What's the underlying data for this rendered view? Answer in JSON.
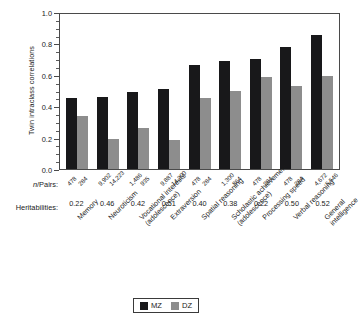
{
  "chart_data": {
    "type": "bar",
    "title": "",
    "xlabel": "",
    "ylabel": "Twin intraclass correlations",
    "ylim": [
      0.0,
      1.0
    ],
    "ytick_labels": [
      "0.0",
      "0.2",
      "0.4",
      "0.6",
      "0.8",
      "1.0"
    ],
    "ytick_values": [
      0.0,
      0.2,
      0.4,
      0.6,
      0.8,
      1.0
    ],
    "minor_tick_step": 0.05,
    "grid": false,
    "legend_position": "bottom-center",
    "categories": [
      "Memory",
      "Neuroticism",
      "Vocational interests (adolescence)",
      "Extraversion",
      "Spatial reasoning",
      "Scholastic achievement (adolescence)",
      "Processing speed",
      "Verbal reasoning",
      "General intelligence"
    ],
    "category_lines": [
      [
        "Memory",
        ""
      ],
      [
        "Neuroticism",
        ""
      ],
      [
        "Vocational interests",
        "(adolescence)"
      ],
      [
        "Extraversion",
        ""
      ],
      [
        "Spatial reasoning",
        ""
      ],
      [
        "Scholastic achievement",
        "(adolescence)"
      ],
      [
        "Processing speed",
        ""
      ],
      [
        "Verbal reasoning",
        ""
      ],
      [
        "General",
        "intelligence"
      ]
    ],
    "series": [
      {
        "name": "MZ",
        "color": "#18181a",
        "values": [
          0.45,
          0.46,
          0.49,
          0.51,
          0.66,
          0.685,
          0.7,
          0.775,
          0.855
        ]
      },
      {
        "name": "DZ",
        "color": "#8d8d8d",
        "values": [
          0.34,
          0.19,
          0.26,
          0.185,
          0.455,
          0.495,
          0.585,
          0.53,
          0.595
        ]
      }
    ],
    "annotation_rows": [
      {
        "label": "n/Pairs:",
        "label_italic_prefix": "n",
        "label_rest": "/Pairs:",
        "mz_values": [
          "478",
          "9,902",
          "1,486",
          "9,887",
          "478",
          "1,300",
          "478",
          "478",
          "4,672"
        ],
        "dz_values": [
          "284",
          "14,223",
          "935",
          "14,200",
          "284",
          "864",
          "284",
          "284",
          "5,546"
        ]
      },
      {
        "label": "Heritabilities:",
        "values": [
          "0.22",
          "0.46",
          "0.42",
          "0.51",
          "0.40",
          "0.38",
          "0.22",
          "0.50",
          "0.52"
        ]
      }
    ]
  },
  "legend": {
    "items": [
      {
        "label": "MZ",
        "color": "#18181a"
      },
      {
        "label": "DZ",
        "color": "#8d8d8d"
      }
    ]
  }
}
